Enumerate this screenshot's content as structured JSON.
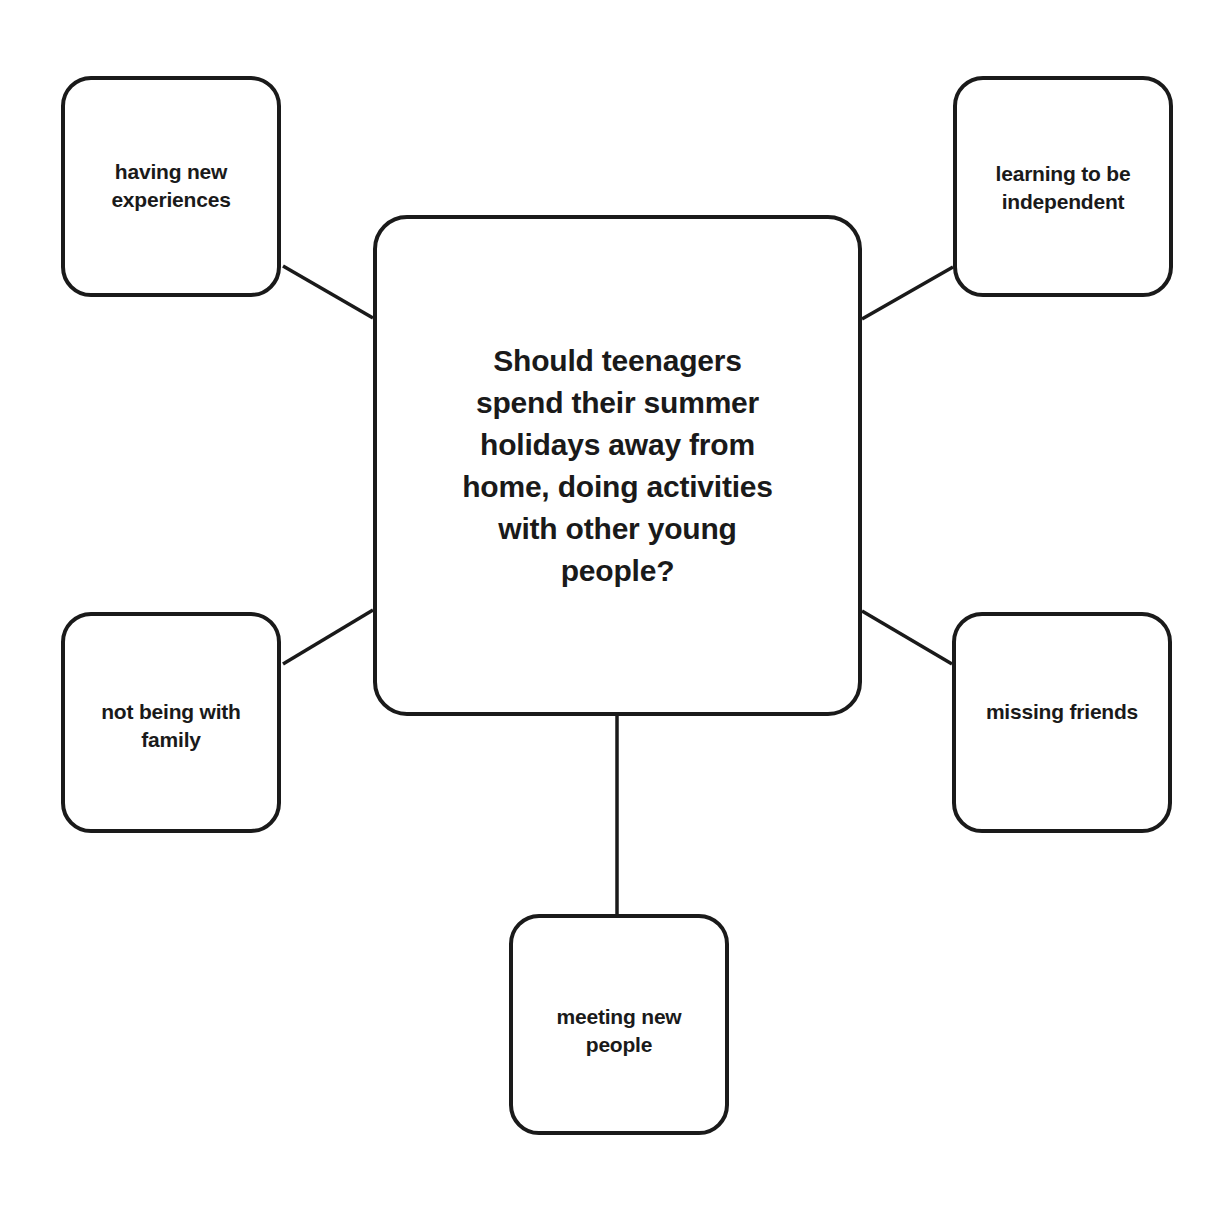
{
  "diagram": {
    "type": "mind-map",
    "title": "Should teenagers spend their summer holidays away from home, doing activities with other young people?",
    "background_color": "#ffffff",
    "stroke_color": "#1a1a1a",
    "text_color": "#1a1a1a",
    "central_node": {
      "id": "central-question",
      "label": "Should teenagers spend their summer holidays away from home, doing activities with other young people?"
    },
    "branches": [
      {
        "id": "having-new-experiences",
        "position": "top-left",
        "label": "having new experiences"
      },
      {
        "id": "learning-to-be-independent",
        "position": "top-right",
        "label": "learning to be independent"
      },
      {
        "id": "not-being-with-family",
        "position": "bottom-left",
        "label": "not being with family"
      },
      {
        "id": "missing-friends",
        "position": "bottom-right",
        "label": "missing friends"
      },
      {
        "id": "meeting-new-people",
        "position": "bottom-center",
        "label": "meeting new people"
      }
    ],
    "connectors": [
      {
        "id": "connector-top-left",
        "from": "having-new-experiences",
        "to": "central-question",
        "x1": 283,
        "y1": 266,
        "x2": 373,
        "y2": 318
      },
      {
        "id": "connector-top-right",
        "from": "central-question",
        "to": "learning-to-be-independent",
        "x1": 862,
        "y1": 319,
        "x2": 953,
        "y2": 267
      },
      {
        "id": "connector-bottom-left",
        "from": "central-question",
        "to": "not-being-with-family",
        "x1": 373,
        "y1": 610,
        "x2": 283,
        "y2": 664
      },
      {
        "id": "connector-bottom-right",
        "from": "central-question",
        "to": "missing-friends",
        "x1": 862,
        "y1": 611,
        "x2": 952,
        "y2": 664
      },
      {
        "id": "connector-bottom-center",
        "from": "central-question",
        "to": "meeting-new-people",
        "x1": 617,
        "y1": 716,
        "x2": 617,
        "y2": 915
      }
    ]
  }
}
